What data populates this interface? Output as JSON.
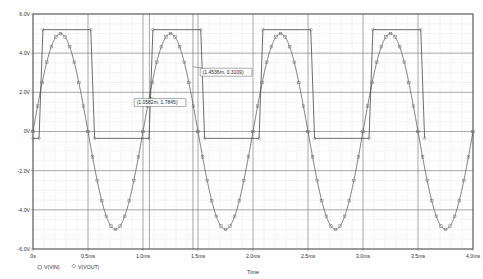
{
  "chart_data": {
    "type": "line",
    "title": "",
    "xlabel": "Time",
    "ylabel": "",
    "grid": true,
    "legend_position": "bottom-left",
    "xlim": [
      0,
      0.004
    ],
    "ylim": [
      -6,
      6
    ],
    "x_tick_labels": [
      "0s",
      "0.5ms",
      "1.0ms",
      "1.5ms",
      "2.0ms",
      "2.5ms",
      "3.0ms",
      "3.5ms",
      "4.0ms"
    ],
    "x_tick_values": [
      0,
      0.0005,
      0.001,
      0.0015,
      0.002,
      0.0025,
      0.003,
      0.0035,
      0.004
    ],
    "y_tick_labels": [
      "6.0V",
      "4.0V",
      "2.0V",
      "0V",
      "-2.0V",
      "-4.0V",
      "-6.0V"
    ],
    "y_tick_values": [
      6,
      4,
      2,
      0,
      -2,
      -4,
      -6
    ],
    "minor_x_per_major": 5,
    "minor_y_per_major": 4,
    "series": [
      {
        "name": "V(VIN)",
        "marker": "square",
        "color": "#555555",
        "waveform": "sine",
        "amplitude": 5.0,
        "offset": 0.0,
        "frequency_hz": 1000,
        "phase_deg": 0,
        "description": "5 V peak sine wave, 1 kHz, centered at 0 V"
      },
      {
        "name": "V(VOUT)",
        "marker": "diamond",
        "color": "#3d3d3d",
        "waveform": "clipped-square",
        "high_level": 5.2,
        "low_level": -0.35,
        "frequency_hz": 1000,
        "duty_cycle": 0.47,
        "description": "Clipped / rectified square output swinging between about -0.35 V and 5.2 V"
      }
    ],
    "annotations": [
      {
        "label": "(1.0582m, 1.7845)",
        "x": 0.0010582,
        "y": 1.7845,
        "box_x": 0.00092,
        "box_y": 1.35
      },
      {
        "label": "(1.4536m, 3.3109)",
        "x": 0.0014536,
        "y": 3.3109,
        "box_x": 0.00152,
        "box_y": 2.9
      }
    ]
  },
  "legend": {
    "entries": [
      {
        "symbol": "square",
        "label": "V(VIN)"
      },
      {
        "symbol": "diamond",
        "label": "V(VOUT)"
      }
    ]
  },
  "axis": {
    "x_title": "Time"
  }
}
